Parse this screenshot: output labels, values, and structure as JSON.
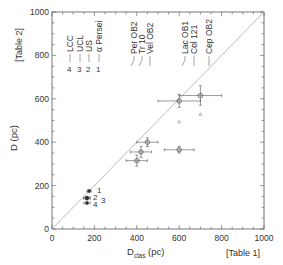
{
  "chart_data": {
    "type": "scatter",
    "title": "",
    "xlabel": "D",
    "xlabel_sub": "clas",
    "xlabel_unit": "(pc)",
    "ylabel": "D (pc)",
    "x_note": "[Table 1]",
    "y_note": "[Table 2]",
    "xlim": [
      0,
      1000
    ],
    "ylim": [
      0,
      1000
    ],
    "xticks": [
      "0",
      "200",
      "400",
      "600",
      "800",
      "1000"
    ],
    "yticks": [
      "0",
      "200",
      "400",
      "600",
      "800",
      "1000"
    ],
    "grid": false,
    "diagonal_line": "y = x",
    "legend": {
      "numbered": [
        {
          "num": "1",
          "label": "α Persei"
        },
        {
          "num": "2",
          "label": "US"
        },
        {
          "num": "3",
          "label": "UCL"
        },
        {
          "num": "4",
          "label": "LCC"
        }
      ],
      "named": [
        "Per OB2",
        "Tr 10",
        "Vel OB2",
        "Lac OB1",
        "Col 121",
        "Cep OB2"
      ]
    },
    "points": [
      {
        "name": "α Persei",
        "label": "1",
        "x": 175,
        "y": 175,
        "xerr": 10,
        "yerr": 5
      },
      {
        "name": "US",
        "label": "2",
        "x": 165,
        "y": 145,
        "xerr": 15,
        "yerr": 5
      },
      {
        "name": "UCL",
        "label": "3",
        "x": 165,
        "y": 140,
        "xerr": 15,
        "yerr": 5
      },
      {
        "name": "LCC",
        "label": "4",
        "x": 165,
        "y": 120,
        "xerr": 15,
        "yerr": 5
      },
      {
        "name": "Per OB2",
        "x": 400,
        "y": 315,
        "xerr": 50,
        "yerr": 25
      },
      {
        "name": "Tr 10",
        "x": 420,
        "y": 355,
        "xerr": 50,
        "yerr": 25
      },
      {
        "name": "Vel OB2",
        "x": 450,
        "y": 400,
        "xerr": 50,
        "yerr": 20
      },
      {
        "name": "Lac OB1",
        "x": 600,
        "y": 365,
        "xerr": 70,
        "yerr": 15
      },
      {
        "name": "Col 121",
        "x": 600,
        "y": 590,
        "xerr": 100,
        "yerr": 30,
        "alt_y": 495
      },
      {
        "name": "Cep OB2",
        "x": 700,
        "y": 615,
        "xerr": 100,
        "yerr": 45,
        "alt_y": 530
      }
    ]
  }
}
